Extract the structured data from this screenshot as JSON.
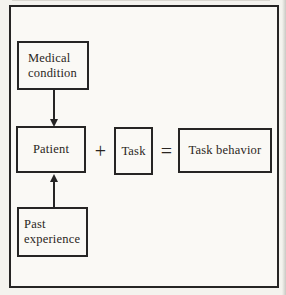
{
  "diagram": {
    "colors": {
      "paper": "#f4f3ee",
      "paper_inner": "#faf9f5",
      "ink": "#262524",
      "text": "#2a2622"
    },
    "nodes": {
      "medical_condition": {
        "label": "Medical\ncondition"
      },
      "patient": {
        "label": "Patient"
      },
      "task": {
        "label": "Task"
      },
      "task_behavior": {
        "label": "Task behavior"
      },
      "past_experience": {
        "label": "Past\nexperience"
      }
    },
    "operators": {
      "plus": "+",
      "equals": "="
    },
    "arrows": [
      {
        "name": "medical-condition-to-patient",
        "direction": "down"
      },
      {
        "name": "past-experience-to-patient",
        "direction": "up"
      }
    ]
  }
}
